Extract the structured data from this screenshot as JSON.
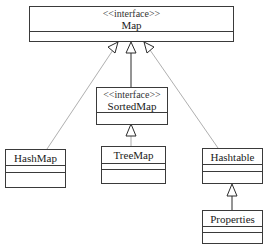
{
  "diagram": {
    "type": "uml-class-diagram",
    "classes": [
      {
        "id": "map",
        "stereotype": "<<interface>>",
        "name": "Map"
      },
      {
        "id": "sortedmap",
        "stereotype": "<<interface>>",
        "name": "SortedMap"
      },
      {
        "id": "hashmap",
        "name": "HashMap"
      },
      {
        "id": "treemap",
        "name": "TreeMap"
      },
      {
        "id": "hashtable",
        "name": "Hashtable"
      },
      {
        "id": "properties",
        "name": "Properties"
      }
    ],
    "relations": [
      {
        "from": "HashMap",
        "to": "Map",
        "kind": "realization"
      },
      {
        "from": "SortedMap",
        "to": "Map",
        "kind": "generalization"
      },
      {
        "from": "Hashtable",
        "to": "Map",
        "kind": "realization"
      },
      {
        "from": "TreeMap",
        "to": "SortedMap",
        "kind": "realization"
      },
      {
        "from": "Properties",
        "to": "Hashtable",
        "kind": "generalization"
      }
    ]
  }
}
